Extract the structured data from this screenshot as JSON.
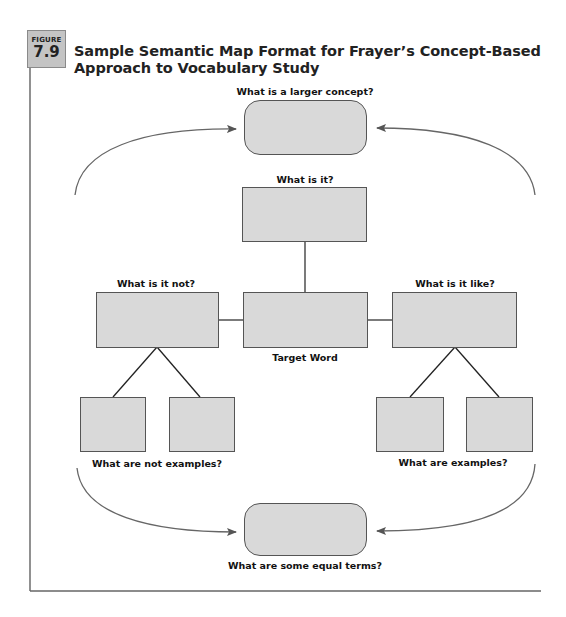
{
  "figure": {
    "badge_word": "FIGURE",
    "badge_number": "7.9",
    "title_line1": "Sample Semantic Map Format for Frayer’s Concept-Based",
    "title_line2": "Approach to Vocabulary Study"
  },
  "diagram": {
    "larger_concept": {
      "label": "What is a larger concept?"
    },
    "what_is_it": {
      "label": "What is it?"
    },
    "what_is_it_not": {
      "label": "What is it not?"
    },
    "target_word": {
      "label": "Target Word"
    },
    "what_is_it_like": {
      "label": "What is it like?"
    },
    "not_examples": {
      "label": "What are not examples?"
    },
    "examples": {
      "label": "What are examples?"
    },
    "equal_terms": {
      "label": "What are some equal terms?"
    }
  },
  "colors": {
    "box_fill": "#d9d9d9",
    "box_border": "#555555",
    "badge_fill": "#c4c4c4",
    "line": "#555555"
  }
}
